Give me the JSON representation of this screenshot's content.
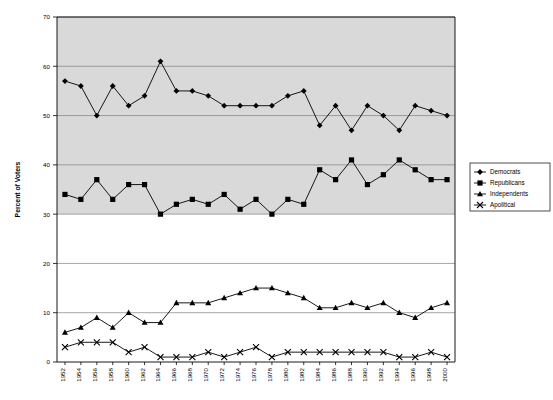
{
  "chart_data": {
    "type": "line",
    "title": "",
    "xlabel": "",
    "ylabel": "Percent of Voters",
    "ylim": [
      0,
      70
    ],
    "ytick_step": 10,
    "yticks": [
      0,
      10,
      20,
      30,
      40,
      50,
      60,
      70
    ],
    "grid": true,
    "legend_position": "right",
    "plot_bg_shaded_above": 30,
    "categories": [
      1952,
      1954,
      1956,
      1958,
      1960,
      1962,
      1964,
      1966,
      1968,
      1970,
      1972,
      1974,
      1976,
      1978,
      1980,
      1982,
      1984,
      1986,
      1988,
      1990,
      1992,
      1994,
      1996,
      1998,
      2000
    ],
    "tick_labels": [
      "1952",
      "1954",
      "1956",
      "1958",
      "1960",
      "1962",
      "1964",
      "1966",
      "1968",
      "1970",
      "1972",
      "1974",
      "1976",
      "1978",
      "1980",
      "1982",
      "1984",
      "1986",
      "1988",
      "1990",
      "1992",
      "1994",
      "1996",
      "1998",
      "2000"
    ],
    "series": [
      {
        "name": "Democrats",
        "marker": "diamond",
        "color": "#000000",
        "values": [
          57,
          56,
          50,
          56,
          52,
          54,
          61,
          55,
          55,
          54,
          52,
          52,
          52,
          52,
          54,
          55,
          48,
          52,
          47,
          52,
          50,
          47,
          52,
          51,
          50
        ]
      },
      {
        "name": "Republicans",
        "marker": "square",
        "color": "#000000",
        "values": [
          34,
          33,
          37,
          33,
          36,
          36,
          30,
          32,
          33,
          32,
          34,
          31,
          33,
          30,
          33,
          32,
          39,
          37,
          41,
          36,
          38,
          41,
          39,
          37,
          37
        ]
      },
      {
        "name": "Independents",
        "marker": "triangle",
        "color": "#000000",
        "values": [
          6,
          7,
          9,
          7,
          10,
          8,
          8,
          12,
          12,
          12,
          13,
          14,
          15,
          15,
          14,
          13,
          11,
          11,
          12,
          11,
          12,
          10,
          9,
          11,
          12
        ]
      },
      {
        "name": "Apolitical",
        "marker": "cross",
        "color": "#000000",
        "values": [
          3,
          4,
          4,
          4,
          2,
          3,
          1,
          1,
          1,
          2,
          1,
          2,
          3,
          1,
          2,
          2,
          2,
          2,
          2,
          2,
          2,
          1,
          1,
          2,
          1
        ]
      }
    ]
  },
  "legend": {
    "items": [
      {
        "label": "Democrats",
        "marker": "diamond"
      },
      {
        "label": "Republicans",
        "marker": "square"
      },
      {
        "label": "Independents",
        "marker": "triangle"
      },
      {
        "label": "Apolitical",
        "marker": "cross"
      }
    ]
  },
  "colors": {
    "plot_shaded": "#d9d9d9",
    "plot_plain": "#ffffff",
    "grid": "#808080",
    "axis": "#000000",
    "series": "#000000"
  }
}
